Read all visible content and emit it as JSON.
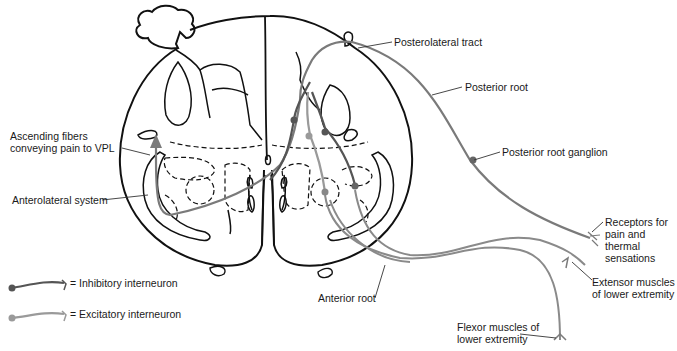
{
  "figure": {
    "colors": {
      "outline": "#111111",
      "afferent_fiber": "#7a7a7a",
      "inhibitory_interneuron": "#555555",
      "excitatory_interneuron": "#9a9a9a",
      "background": "#ffffff"
    }
  },
  "labels": {
    "posterolateral_tract": "Posterolateral tract",
    "posterior_root": "Posterior root",
    "ascending_fibers": "Ascending fibers\nconveying pain to VPL",
    "posterior_root_ganglion": "Posterior root ganglion",
    "anterolateral_system": "Anterolateral system",
    "receptors": "Receptors for\npain and\nthermal\nsensations",
    "extensor_muscles": "Extensor muscles\nof lower extremity",
    "anterior_root": "Anterior root",
    "flexor_muscles": "Flexor muscles of\nlower extremity"
  },
  "legend": {
    "items": [
      {
        "label": "= Inhibitory interneuron",
        "icon": "inhibitory-neuron-icon",
        "color": "#555555"
      },
      {
        "label": "= Excitatory interneuron",
        "icon": "excitatory-neuron-icon",
        "color": "#9a9a9a"
      }
    ]
  }
}
